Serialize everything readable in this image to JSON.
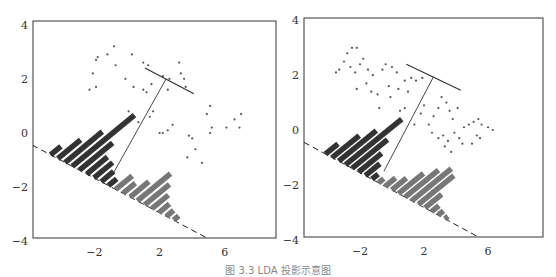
{
  "caption": "图 3.3 LDA 投影示意图",
  "chart_data": [
    {
      "type": "scatter",
      "title": "Projection onto w (poor separation)",
      "xlabel": "",
      "ylabel": "",
      "xlim": [
        -5.8,
        9.0
      ],
      "ylim": [
        -4,
        4
      ],
      "xticks": [
        -2,
        2,
        6
      ],
      "yticks": [
        -4,
        -2,
        0,
        2,
        4
      ],
      "frame": {
        "x": 33,
        "y": 21,
        "w": 243,
        "h": 217
      },
      "px_per_unit": {
        "x": 16.3,
        "y": 27.1
      },
      "origin_px": {
        "x": 127,
        "y": 133
      },
      "projection_line": {
        "x1": -5.8,
        "y1": -0.45,
        "x2": 5.3,
        "y2": -4.0,
        "style": "dashed"
      },
      "separator": {
        "x1": 1.1,
        "y1": 2.4,
        "x2": 4.1,
        "y2": 1.45
      },
      "connector": {
        "x1": 2.4,
        "y1": 2.0,
        "x2": -0.9,
        "y2": -1.55
      },
      "series": [
        {
          "name": "class 1",
          "points": [
            [
              -2.3,
              1.6
            ],
            [
              -2.1,
              2.2
            ],
            [
              -1.9,
              2.7
            ],
            [
              -1.8,
              2.8
            ],
            [
              -1.9,
              1.7
            ],
            [
              -1.2,
              2.9
            ],
            [
              -0.8,
              3.2
            ],
            [
              -0.7,
              2.5
            ],
            [
              -0.1,
              2.0
            ],
            [
              0.3,
              2.9
            ],
            [
              0.4,
              1.7
            ],
            [
              1.0,
              2.6
            ],
            [
              1.3,
              2.5
            ],
            [
              1.0,
              1.6
            ],
            [
              1.2,
              1.5
            ],
            [
              1.5,
              1.8
            ],
            [
              2.2,
              2.1
            ],
            [
              2.5,
              1.6
            ],
            [
              2.6,
              2.0
            ],
            [
              3.2,
              2.6
            ],
            [
              3.3,
              2.2
            ],
            [
              3.5,
              2.0
            ],
            [
              3.6,
              1.7
            ],
            [
              0.1,
              0.8
            ],
            [
              0.7,
              0.4
            ],
            [
              1.4,
              0.6
            ],
            [
              1.6,
              0.8
            ],
            [
              2.0,
              0.0
            ],
            [
              2.2,
              0.0
            ],
            [
              2.5,
              0.1
            ],
            [
              2.8,
              0.3
            ]
          ]
        },
        {
          "name": "class 2",
          "points": [
            [
              3.8,
              -0.1
            ],
            [
              4.0,
              -0.2
            ],
            [
              4.2,
              -0.6
            ],
            [
              3.7,
              -0.9
            ],
            [
              4.6,
              -1.1
            ],
            [
              4.9,
              0.7
            ],
            [
              5.1,
              1.0
            ],
            [
              5.2,
              0.2
            ],
            [
              5.1,
              0.0
            ],
            [
              6.1,
              0.2
            ],
            [
              6.6,
              0.5
            ],
            [
              7.0,
              0.7
            ],
            [
              6.9,
              0.2
            ]
          ]
        }
      ],
      "histogram_bars": {
        "class1_heights": [
          0.5,
          1.1,
          1.8,
          3.0,
          1.6,
          1.0,
          0.9,
          0.6,
          0.4
        ],
        "class2_heights": [
          0.8,
          0.6,
          0.9,
          1.6,
          1.2,
          0.8,
          0.5,
          0.35,
          0.25
        ],
        "class1_color": "#333333",
        "class2_color": "#777777"
      }
    },
    {
      "type": "scatter",
      "title": "Projection onto LDA direction (good separation)",
      "xlabel": "",
      "ylabel": "",
      "xlim": [
        -5.5,
        9.2
      ],
      "ylim": [
        -4,
        4
      ],
      "xticks": [
        -2,
        2,
        6
      ],
      "yticks": [
        -4,
        -2,
        0,
        2,
        4
      ],
      "frame": {
        "x": 304,
        "y": 18,
        "w": 239,
        "h": 219
      },
      "px_per_unit": {
        "x": 16.0,
        "y": 27.4
      },
      "origin_px": {
        "x": 392,
        "y": 130
      },
      "projection_line": {
        "x1": -5.5,
        "y1": -0.45,
        "x2": 5.7,
        "y2": -4.0,
        "style": "dashed"
      },
      "separator": {
        "x1": 0.9,
        "y1": 2.4,
        "x2": 4.3,
        "y2": 1.45
      },
      "connector": {
        "x1": 2.6,
        "y1": 1.95,
        "x2": -0.5,
        "y2": -1.5
      },
      "series": [
        {
          "name": "class 1",
          "points": [
            [
              -3.5,
              2.1
            ],
            [
              -3.3,
              2.2
            ],
            [
              -3.0,
              2.5
            ],
            [
              -2.8,
              2.8
            ],
            [
              -2.5,
              3.0
            ],
            [
              -2.2,
              3.0
            ],
            [
              -2.6,
              2.3
            ],
            [
              -2.3,
              2.1
            ],
            [
              -2.0,
              2.4
            ],
            [
              -1.8,
              2.6
            ],
            [
              -1.5,
              2.2
            ],
            [
              -1.2,
              2.0
            ],
            [
              -2.2,
              1.5
            ],
            [
              -1.6,
              1.7
            ],
            [
              -1.3,
              1.4
            ],
            [
              -0.9,
              1.3
            ],
            [
              -0.6,
              2.2
            ],
            [
              -0.4,
              2.4
            ],
            [
              0.0,
              2.3
            ],
            [
              0.3,
              2.1
            ],
            [
              -0.2,
              1.6
            ],
            [
              0.4,
              1.5
            ],
            [
              -0.1,
              1.2
            ],
            [
              0.8,
              1.8
            ],
            [
              1.2,
              1.9
            ],
            [
              1.5,
              1.8
            ],
            [
              1.9,
              1.9
            ],
            [
              -0.8,
              0.8
            ],
            [
              0.5,
              0.7
            ],
            [
              0.8,
              0.8
            ],
            [
              1.0,
              1.4
            ]
          ]
        },
        {
          "name": "class 2",
          "points": [
            [
              1.4,
              0.2
            ],
            [
              1.8,
              0.6
            ],
            [
              2.0,
              0.9
            ],
            [
              2.3,
              0.2
            ],
            [
              2.6,
              0.5
            ],
            [
              2.9,
              0.8
            ],
            [
              3.1,
              1.2
            ],
            [
              3.4,
              1.0
            ],
            [
              3.6,
              0.7
            ],
            [
              3.8,
              0.4
            ],
            [
              4.1,
              0.8
            ],
            [
              2.5,
              -0.1
            ],
            [
              2.9,
              -0.3
            ],
            [
              3.2,
              -0.2
            ],
            [
              3.5,
              -0.4
            ],
            [
              3.9,
              -0.1
            ],
            [
              4.2,
              -0.3
            ],
            [
              4.5,
              0.1
            ],
            [
              4.8,
              0.2
            ],
            [
              5.1,
              0.3
            ],
            [
              5.4,
              0.4
            ],
            [
              5.6,
              0.2
            ],
            [
              3.3,
              -0.6
            ],
            [
              3.7,
              -0.8
            ],
            [
              4.4,
              -0.5
            ],
            [
              5.0,
              -0.5
            ],
            [
              5.5,
              -0.3
            ],
            [
              6.0,
              0.1
            ],
            [
              6.3,
              0.0
            ],
            [
              5.3,
              -0.2
            ]
          ]
        }
      ],
      "histogram_bars": {
        "class1_heights": [
          0.6,
          1.3,
          1.8,
          2.7,
          1.7,
          1.1,
          0.7,
          0.3
        ],
        "class2_heights": [
          0.25,
          0.5,
          0.7,
          1.2,
          1.6,
          1.9,
          1.7,
          0.8,
          0.35,
          0.25,
          0.15
        ],
        "class1_color": "#333333",
        "class2_color": "#777777"
      }
    }
  ]
}
